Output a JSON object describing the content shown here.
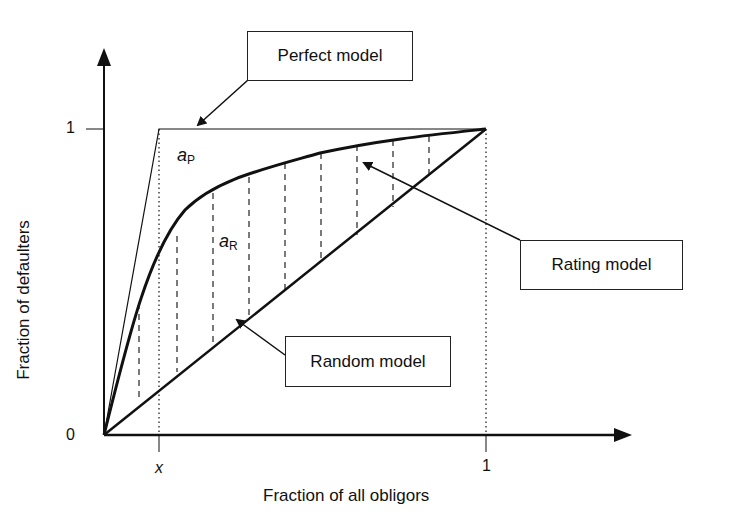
{
  "diagram": {
    "type": "CAP curve (cumulative accuracy profile)",
    "x_axis": {
      "label": "Fraction of all obligors",
      "ticks": [
        {
          "label": "x",
          "italic": true
        },
        {
          "label": "1"
        }
      ]
    },
    "y_axis": {
      "label": "Fraction of defaulters",
      "ticks": [
        {
          "label": "0"
        },
        {
          "label": "1"
        }
      ]
    },
    "curves": [
      {
        "name": "Perfect model",
        "description": "rises linearly from origin to 1 at x, then flat at 1"
      },
      {
        "name": "Rating model",
        "description": "concave curve from origin to (1,1)"
      },
      {
        "name": "Random model",
        "description": "diagonal from origin to (1,1)"
      }
    ],
    "area_labels": {
      "a_p": {
        "base": "a",
        "sub": "P"
      },
      "a_r": {
        "base": "a",
        "sub": "R"
      }
    },
    "callouts": {
      "perfect": "Perfect model",
      "rating": "Rating model",
      "random": "Random model"
    },
    "colors": {
      "ink": "#111111",
      "background": "#ffffff"
    }
  }
}
